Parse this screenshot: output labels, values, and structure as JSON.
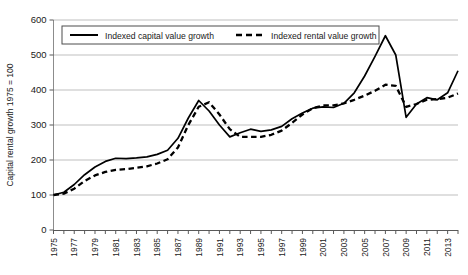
{
  "chart_data": {
    "type": "line",
    "title": "",
    "xlabel": "",
    "ylabel": "Capital rental growth 1975 = 100",
    "ylim": [
      0,
      600
    ],
    "ytick_labels": [
      "0",
      "100",
      "200",
      "300",
      "400",
      "500",
      "600"
    ],
    "yticks": [
      0,
      100,
      200,
      300,
      400,
      500,
      600
    ],
    "grid": true,
    "legend_position": "top-left-inside",
    "xlim": [
      1975,
      2014
    ],
    "x": [
      1975,
      1976,
      1977,
      1978,
      1979,
      1980,
      1981,
      1982,
      1983,
      1984,
      1985,
      1986,
      1987,
      1988,
      1989,
      1990,
      1991,
      1992,
      1993,
      1994,
      1995,
      1996,
      1997,
      1998,
      1999,
      2000,
      2001,
      2002,
      2003,
      2004,
      2005,
      2006,
      2007,
      2008,
      2009,
      2010,
      2011,
      2012,
      2013,
      2014
    ],
    "xtick_labels": [
      "1975",
      "1977",
      "1979",
      "1981",
      "1983",
      "1985",
      "1987",
      "1989",
      "1991",
      "1993",
      "1995",
      "1997",
      "1999",
      "2001",
      "2003",
      "2005",
      "2007",
      "2009",
      "2011",
      "2013"
    ],
    "xticks": [
      1975,
      1977,
      1979,
      1981,
      1983,
      1985,
      1987,
      1989,
      1991,
      1993,
      1995,
      1997,
      1999,
      2001,
      2003,
      2005,
      2007,
      2009,
      2011,
      2013
    ],
    "series": [
      {
        "name": "Indexed capital value growth",
        "style": "solid",
        "color": "#000000",
        "values": [
          100,
          108,
          130,
          158,
          180,
          196,
          205,
          204,
          206,
          209,
          216,
          228,
          262,
          320,
          370,
          340,
          300,
          266,
          278,
          288,
          282,
          286,
          296,
          318,
          334,
          348,
          352,
          350,
          362,
          392,
          440,
          496,
          555,
          500,
          322,
          360,
          378,
          372,
          392,
          455
        ]
      },
      {
        "name": "Indexed rental value growth",
        "style": "dashed",
        "color": "#000000",
        "values": [
          100,
          104,
          118,
          140,
          156,
          166,
          172,
          174,
          178,
          182,
          190,
          202,
          236,
          300,
          352,
          365,
          330,
          288,
          266,
          266,
          266,
          272,
          284,
          306,
          330,
          348,
          356,
          356,
          362,
          372,
          384,
          398,
          415,
          412,
          352,
          360,
          372,
          374,
          378,
          390
        ]
      }
    ]
  },
  "axis": {
    "y_title": "Capital rental growth 1975 = 100"
  },
  "legend": {
    "items": [
      {
        "label": "Indexed capital value growth",
        "marker": "solid-line-marker"
      },
      {
        "label": "Indexed rental value growth",
        "marker": "dashed-line-marker"
      }
    ]
  }
}
